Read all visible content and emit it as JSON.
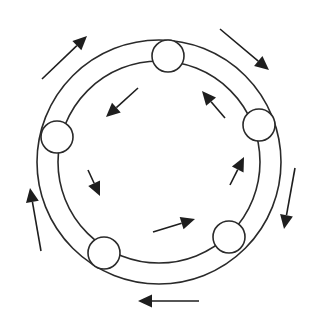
{
  "diagram": {
    "title": "",
    "colors": {
      "stroke": "#2a2a2a",
      "fill": "#ffffff",
      "arrow": "#1e1e1e"
    },
    "center": {
      "x": 159,
      "y": 162
    },
    "rings": [
      {
        "name": "outer-ring",
        "r": 122
      },
      {
        "name": "inner-ring",
        "r": 101
      }
    ],
    "nodes": [
      {
        "name": "node-top",
        "cx": 168,
        "cy": 56,
        "r": 16
      },
      {
        "name": "node-right",
        "cx": 259,
        "cy": 125,
        "r": 16
      },
      {
        "name": "node-bottom-right",
        "cx": 229,
        "cy": 237,
        "r": 16
      },
      {
        "name": "node-bottom-left",
        "cx": 104,
        "cy": 253,
        "r": 16
      },
      {
        "name": "node-left",
        "cx": 57,
        "cy": 137,
        "r": 16
      }
    ],
    "outer_arrows": [
      {
        "name": "arrow-outer-top-left",
        "x1": 42,
        "y1": 79,
        "x2": 87,
        "y2": 36
      },
      {
        "name": "arrow-outer-top-right",
        "x1": 220,
        "y1": 29,
        "x2": 269,
        "y2": 70
      },
      {
        "name": "arrow-outer-right",
        "x1": 295,
        "y1": 168,
        "x2": 284,
        "y2": 229
      },
      {
        "name": "arrow-outer-bottom",
        "x1": 199,
        "y1": 301,
        "x2": 138,
        "y2": 301
      },
      {
        "name": "arrow-outer-left",
        "x1": 41,
        "y1": 251,
        "x2": 30,
        "y2": 188
      }
    ],
    "inner_arrows": [
      {
        "name": "arrow-inner-top-left",
        "x1": 138,
        "y1": 88,
        "x2": 106,
        "y2": 117
      },
      {
        "name": "arrow-inner-top-right",
        "x1": 225,
        "y1": 118,
        "x2": 202,
        "y2": 91
      },
      {
        "name": "arrow-inner-left",
        "x1": 88,
        "y1": 170,
        "x2": 100,
        "y2": 196
      },
      {
        "name": "arrow-inner-bottom",
        "x1": 153,
        "y1": 232,
        "x2": 195,
        "y2": 219
      },
      {
        "name": "arrow-inner-right",
        "x1": 230,
        "y1": 185,
        "x2": 244,
        "y2": 157
      }
    ]
  }
}
